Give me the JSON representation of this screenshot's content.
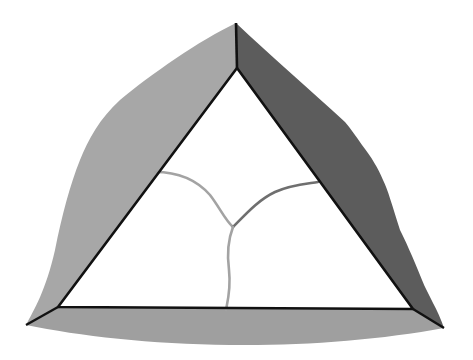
{
  "diagram": {
    "kind": "faceted triangle with internal three-way branch",
    "size": {
      "width": 473,
      "height": 360
    },
    "colors": {
      "background": "#ffffff",
      "left_face": "#a7a7a7",
      "right_face": "#5c5c5c",
      "bottom_face": "#9f9f9f",
      "edge": "#111111",
      "branch_light": "#a3a3a3",
      "branch_dark": "#6f6f6f",
      "interior": "#ffffff"
    },
    "outer_vertices": {
      "top": [
        236,
        23
      ],
      "bottom_left": [
        26,
        325
      ],
      "bottom_right": [
        444,
        328
      ]
    },
    "inner_vertices": {
      "top": [
        237,
        68
      ],
      "bottom_left": [
        58,
        307
      ],
      "bottom_right": [
        413,
        309
      ]
    },
    "branches": {
      "junction": [
        233,
        227
      ],
      "left_end": [
        155,
        172
      ],
      "right_end": [
        318,
        182
      ],
      "bottom_end": [
        226,
        310
      ]
    }
  }
}
